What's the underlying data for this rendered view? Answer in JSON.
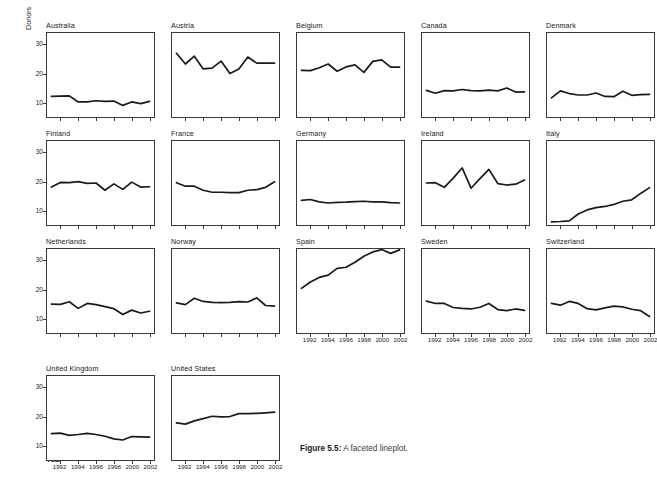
{
  "figure": {
    "caption_label": "Figure 5.5:",
    "caption_text": " A faceted lineplot.",
    "ylabel": "Donors",
    "xlabel": "Year"
  },
  "chart_data": {
    "type": "line",
    "title": "",
    "xlabel": "Year",
    "ylabel": "Donors",
    "xlim": [
      1990.5,
      2002.5
    ],
    "ylim": [
      5,
      34
    ],
    "xticks": [
      1992,
      1994,
      1996,
      1998,
      2000,
      2002
    ],
    "yticks": [
      10,
      20,
      30
    ],
    "grid": false,
    "legend": "none",
    "facet_layout": {
      "columns": 5,
      "rows": 4
    },
    "x": [
      1991,
      1992,
      1993,
      1994,
      1995,
      1996,
      1997,
      1998,
      1999,
      2000,
      2001,
      2002
    ],
    "series": [
      {
        "name": "Australia",
        "values": [
          12.1,
          12.2,
          12.3,
          10.2,
          10.2,
          10.6,
          10.4,
          10.5,
          9.0,
          10.2,
          9.6,
          10.4
        ]
      },
      {
        "name": "Austria",
        "values": [
          27.0,
          23.3,
          26.0,
          21.6,
          21.9,
          24.3,
          20.0,
          21.6,
          25.7,
          23.6,
          23.6,
          23.6
        ]
      },
      {
        "name": "Belgium",
        "values": [
          21.1,
          21.0,
          22.0,
          23.3,
          20.8,
          22.3,
          23.0,
          20.4,
          24.2,
          24.7,
          22.2,
          22.2
        ]
      },
      {
        "name": "Canada",
        "values": [
          14.2,
          13.2,
          14.1,
          14.0,
          14.5,
          14.1,
          14.0,
          14.3,
          14.0,
          15.0,
          13.6,
          13.7
        ]
      },
      {
        "name": "Denmark",
        "values": [
          11.6,
          14.0,
          13.1,
          12.6,
          12.6,
          13.3,
          12.1,
          12.0,
          13.9,
          12.5,
          12.7,
          12.8
        ]
      },
      {
        "name": "Finland",
        "values": [
          18.1,
          19.7,
          19.6,
          20.0,
          19.4,
          19.5,
          17.0,
          19.2,
          17.3,
          19.8,
          18.1,
          18.2
        ]
      },
      {
        "name": "France",
        "values": [
          19.6,
          18.4,
          18.4,
          17.0,
          16.3,
          16.3,
          16.2,
          16.2,
          17.0,
          17.2,
          18.0,
          19.9
        ]
      },
      {
        "name": "Germany",
        "values": [
          13.5,
          13.8,
          13.0,
          12.6,
          12.8,
          12.9,
          13.1,
          13.2,
          13.0,
          13.0,
          12.7,
          12.6
        ]
      },
      {
        "name": "Ireland",
        "values": [
          19.5,
          19.6,
          18.0,
          21.2,
          24.7,
          17.7,
          21.0,
          24.2,
          19.3,
          18.8,
          19.1,
          20.5
        ]
      },
      {
        "name": "Italy",
        "values": [
          6.1,
          6.2,
          6.4,
          8.8,
          10.2,
          11.0,
          11.4,
          12.1,
          13.2,
          13.7,
          15.9,
          17.9
        ]
      },
      {
        "name": "Netherlands",
        "values": [
          15.0,
          14.9,
          15.8,
          13.5,
          15.2,
          14.8,
          14.1,
          13.4,
          11.4,
          12.9,
          11.9,
          12.5
        ]
      },
      {
        "name": "Norway",
        "values": [
          15.4,
          14.8,
          17.0,
          15.9,
          15.6,
          15.5,
          15.6,
          15.8,
          15.7,
          17.1,
          14.5,
          14.3
        ]
      },
      {
        "name": "Spain",
        "values": [
          20.4,
          22.6,
          24.2,
          25.0,
          27.3,
          27.7,
          29.4,
          31.5,
          33.0,
          33.8,
          32.5,
          33.7
        ]
      },
      {
        "name": "Sweden",
        "values": [
          16.0,
          15.2,
          15.2,
          13.8,
          13.5,
          13.3,
          13.9,
          15.2,
          13.1,
          12.7,
          13.3,
          12.8
        ]
      },
      {
        "name": "Switzerland",
        "values": [
          15.2,
          14.6,
          15.9,
          15.2,
          13.4,
          13.0,
          13.7,
          14.3,
          14.0,
          13.2,
          12.7,
          10.7
        ]
      },
      {
        "name": "United Kingdom",
        "values": [
          14.1,
          14.3,
          13.5,
          13.8,
          14.2,
          13.8,
          13.2,
          12.3,
          11.9,
          13.1,
          13.0,
          12.9
        ]
      },
      {
        "name": "United States",
        "values": [
          17.8,
          17.4,
          18.5,
          19.3,
          20.1,
          19.9,
          20.0,
          21.0,
          21.0,
          21.1,
          21.3,
          21.5
        ]
      }
    ]
  },
  "panels": [
    {
      "name": "Australia",
      "row": 0,
      "col": 0
    },
    {
      "name": "Austria",
      "row": 0,
      "col": 1
    },
    {
      "name": "Belgium",
      "row": 0,
      "col": 2
    },
    {
      "name": "Canada",
      "row": 0,
      "col": 3
    },
    {
      "name": "Denmark",
      "row": 0,
      "col": 4
    },
    {
      "name": "Finland",
      "row": 1,
      "col": 0
    },
    {
      "name": "France",
      "row": 1,
      "col": 1
    },
    {
      "name": "Germany",
      "row": 1,
      "col": 2
    },
    {
      "name": "Ireland",
      "row": 1,
      "col": 3
    },
    {
      "name": "Italy",
      "row": 1,
      "col": 4
    },
    {
      "name": "Netherlands",
      "row": 2,
      "col": 0
    },
    {
      "name": "Norway",
      "row": 2,
      "col": 1
    },
    {
      "name": "Spain",
      "row": 2,
      "col": 2
    },
    {
      "name": "Sweden",
      "row": 2,
      "col": 3
    },
    {
      "name": "Switzerland",
      "row": 2,
      "col": 4
    },
    {
      "name": "United Kingdom",
      "row": 3,
      "col": 0
    },
    {
      "name": "United States",
      "row": 3,
      "col": 1
    }
  ],
  "style": {
    "line_color": "#1a1a1a",
    "axis_color": "#3a3a3a",
    "background": "#ffffff"
  }
}
